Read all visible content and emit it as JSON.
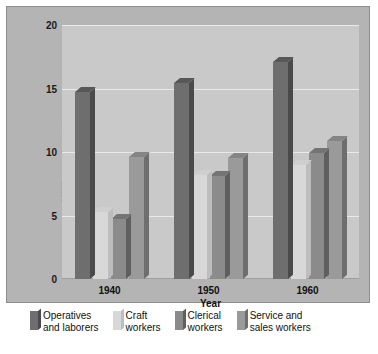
{
  "chart_data": {
    "type": "bar",
    "title": "",
    "subtitle": "",
    "xlabel": "Year",
    "ylabel": "Millions of workers",
    "categories": [
      "1940",
      "1950",
      "1960"
    ],
    "ylim": [
      0,
      20
    ],
    "yticks": [
      0,
      5,
      10,
      15,
      20
    ],
    "ytick_labels": [
      "0",
      "5",
      "10",
      "15",
      "20"
    ],
    "grid": true,
    "legend_position": "bottom",
    "style": "3d-grouped-bar",
    "series": [
      {
        "name": "Operatives and laborers",
        "legend_label_line1": "Operatives",
        "legend_label_line2": "and laborers",
        "color": "#6e6e6e",
        "side_color": "#4a4a4a",
        "top_color": "#585858",
        "values": [
          14.7,
          15.4,
          17.1
        ]
      },
      {
        "name": "Craft workers",
        "legend_label_line1": "Craft",
        "legend_label_line2": "workers",
        "color": "#d8d8d8",
        "side_color": "#bdbdbd",
        "top_color": "#cfcfcf",
        "values": [
          5.3,
          8.2,
          9.0
        ]
      },
      {
        "name": "Clerical workers",
        "legend_label_line1": "Clerical",
        "legend_label_line2": "workers",
        "color": "#8b8b8b",
        "side_color": "#5f5f5f",
        "top_color": "#747474",
        "values": [
          4.7,
          8.1,
          9.9
        ]
      },
      {
        "name": "Service and sales workers",
        "legend_label_line1": "Service and",
        "legend_label_line2": "sales workers",
        "color": "#9a9a9a",
        "side_color": "#6e6e6e",
        "top_color": "#858585",
        "values": [
          9.6,
          9.5,
          10.9
        ]
      }
    ]
  },
  "colors": {
    "figure_background": "#ffffff",
    "panel_background": "#b4b4b4",
    "panel_border": "#8e8e8e",
    "plot_background": "#c9c9c9",
    "gridline": "#e9e9e9",
    "axis_line": "#9d9d9d",
    "text": "#111111"
  }
}
